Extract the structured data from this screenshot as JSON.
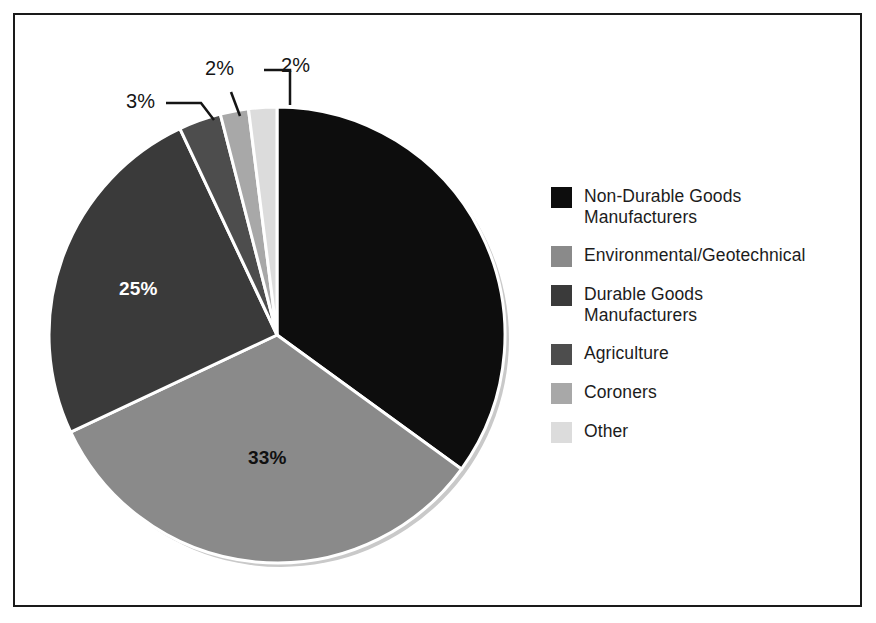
{
  "chart_data": {
    "type": "pie",
    "title": "",
    "categories": [
      "Non-Durable Goods Manufacturers",
      "Environmental/Geotechnical",
      "Durable Goods Manufacturers",
      "Agriculture",
      "Coroners",
      "Other"
    ],
    "values": [
      35,
      33,
      25,
      3,
      2,
      2
    ],
    "value_labels": [
      "35%",
      "33%",
      "25%",
      "3%",
      "2%",
      "2%"
    ],
    "colors": [
      "#0d0d0d",
      "#8a8a8a",
      "#3a3a3a",
      "#4d4d4d",
      "#a8a8a8",
      "#dcdcdc"
    ],
    "start_angle_deg": 0,
    "direction": "clockwise",
    "legend_position": "right",
    "grid": false,
    "xlabel": "",
    "ylabel": ""
  },
  "legend": {
    "items": [
      {
        "label": "Non-Durable Goods\nManufacturers",
        "color": "#0d0d0d"
      },
      {
        "label": "Environmental/Geotechnical",
        "color": "#8a8a8a"
      },
      {
        "label": "Durable Goods\nManufacturers",
        "color": "#3a3a3a"
      },
      {
        "label": "Agriculture",
        "color": "#4d4d4d"
      },
      {
        "label": "Coroners",
        "color": "#a8a8a8"
      },
      {
        "label": "Other",
        "color": "#dcdcdc"
      }
    ]
  },
  "slice_labels": {
    "durable_goods": "25%",
    "environmental": "33%"
  },
  "callouts": {
    "agriculture": "3%",
    "coroners": "2%",
    "other": "2%"
  }
}
